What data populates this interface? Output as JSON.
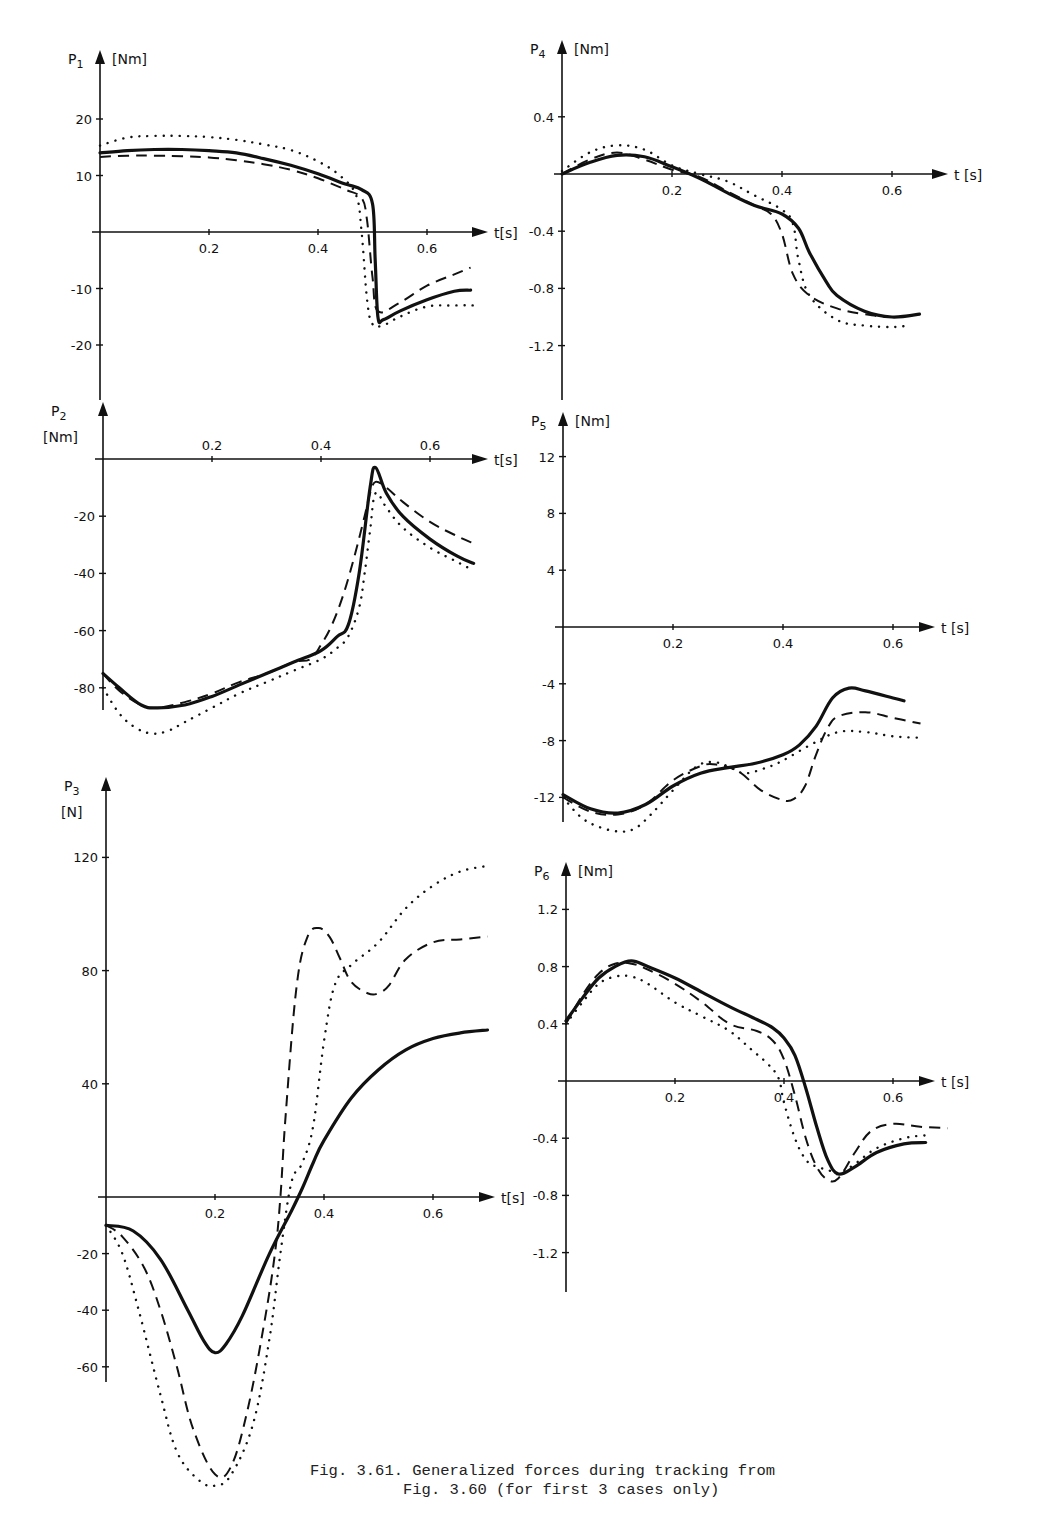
{
  "caption": {
    "line1": "Fig. 3.61. Generalized forces during tracking from",
    "line2": "          Fig. 3.60 (for first 3 cases only)"
  },
  "chart_data": [
    {
      "id": "P1",
      "type": "line",
      "title": "P1",
      "ylabel": "P1 [Nm]",
      "xlabel": "t[s]",
      "xticks": [
        0.2,
        0.4,
        0.6
      ],
      "yticks": [
        20,
        10,
        -10,
        -20
      ],
      "ylim": [
        -30,
        25
      ],
      "xlim": [
        0,
        0.7
      ],
      "frame": {
        "x0": 100,
        "y0": 232,
        "px_per_x": 545,
        "px_per_y": 5.65,
        "ytop": 50,
        "ybot": 400,
        "xend": 488
      },
      "series": [
        {
          "name": "case 1 (solid)",
          "style": "solid",
          "x": [
            0,
            0.05,
            0.1,
            0.15,
            0.2,
            0.25,
            0.3,
            0.35,
            0.4,
            0.45,
            0.48,
            0.5,
            0.505,
            0.51,
            0.52,
            0.55,
            0.6,
            0.65,
            0.68
          ],
          "y": [
            14,
            14.4,
            14.6,
            14.6,
            14.4,
            14,
            13,
            11.8,
            10.3,
            8.5,
            7.5,
            5,
            -5,
            -15,
            -15.5,
            -14,
            -12,
            -10.5,
            -10.3
          ]
        },
        {
          "name": "case 2 (dashed)",
          "style": "dashed",
          "x": [
            0,
            0.05,
            0.1,
            0.15,
            0.2,
            0.25,
            0.3,
            0.35,
            0.4,
            0.45,
            0.48,
            0.49,
            0.5,
            0.51,
            0.55,
            0.6,
            0.65,
            0.68
          ],
          "y": [
            13.3,
            13.5,
            13.5,
            13.4,
            13.2,
            12.7,
            12,
            11,
            9.5,
            7.5,
            6,
            2,
            -8,
            -14,
            -12.5,
            -9.5,
            -7.5,
            -6.3
          ]
        },
        {
          "name": "case 3 (dotted)",
          "style": "dotted",
          "x": [
            0,
            0.05,
            0.1,
            0.15,
            0.2,
            0.25,
            0.3,
            0.35,
            0.4,
            0.44,
            0.47,
            0.48,
            0.49,
            0.5,
            0.52,
            0.55,
            0.6,
            0.65,
            0.69
          ],
          "y": [
            15.3,
            16.7,
            17,
            17,
            16.8,
            16.3,
            15.5,
            14.5,
            12.5,
            10,
            6.5,
            0,
            -12,
            -16.3,
            -16.5,
            -15,
            -13.2,
            -13,
            -13
          ]
        }
      ]
    },
    {
      "id": "P2",
      "type": "line",
      "title": "P2",
      "ylabel": "P2 [Nm]",
      "xlabel": "t[s]",
      "xticks": [
        0.2,
        0.4,
        0.6
      ],
      "yticks": [
        -20,
        -40,
        -60,
        -80
      ],
      "ylim": [
        -100,
        10
      ],
      "xlim": [
        0,
        0.7
      ],
      "frame": {
        "x0": 103,
        "y0": 459,
        "px_per_x": 545,
        "px_per_y": 2.86,
        "ytop": 402,
        "ybot": 710,
        "xend": 488
      },
      "series": [
        {
          "name": "case 1 (solid)",
          "style": "solid",
          "x": [
            0,
            0.03,
            0.07,
            0.1,
            0.15,
            0.2,
            0.25,
            0.3,
            0.35,
            0.4,
            0.43,
            0.45,
            0.47,
            0.49,
            0.5,
            0.52,
            0.55,
            0.6,
            0.65,
            0.68
          ],
          "y": [
            -75,
            -80,
            -86,
            -87,
            -86,
            -83,
            -79,
            -75,
            -71,
            -67,
            -62,
            -58,
            -40,
            -10,
            -3,
            -12,
            -20,
            -28,
            -34,
            -36.5
          ]
        },
        {
          "name": "case 2 (dashed)",
          "style": "dashed",
          "x": [
            0,
            0.03,
            0.07,
            0.1,
            0.15,
            0.2,
            0.25,
            0.3,
            0.35,
            0.38,
            0.4,
            0.42,
            0.44,
            0.46,
            0.48,
            0.49,
            0.5,
            0.52,
            0.55,
            0.6,
            0.65,
            0.68
          ],
          "y": [
            -75,
            -81,
            -86,
            -87,
            -85,
            -82,
            -78,
            -75,
            -71,
            -70,
            -65,
            -58,
            -48,
            -35,
            -20,
            -12,
            -8,
            -10,
            -15,
            -22,
            -27,
            -29.5
          ]
        },
        {
          "name": "case 3 (dotted)",
          "style": "dotted",
          "x": [
            0,
            0.03,
            0.06,
            0.09,
            0.12,
            0.15,
            0.2,
            0.25,
            0.3,
            0.35,
            0.4,
            0.43,
            0.45,
            0.47,
            0.48,
            0.49,
            0.5,
            0.52,
            0.55,
            0.6,
            0.65,
            0.68
          ],
          "y": [
            -80,
            -89,
            -94,
            -96,
            -95,
            -92,
            -87,
            -82,
            -78,
            -74,
            -70,
            -66,
            -62,
            -52,
            -40,
            -25,
            -12,
            -17,
            -24,
            -31,
            -36,
            -39
          ]
        }
      ]
    },
    {
      "id": "P3",
      "type": "line",
      "title": "P3",
      "ylabel": "P3 [N]",
      "xlabel": "t[s]",
      "xticks": [
        0.2,
        0.4,
        0.6
      ],
      "yticks": [
        120,
        80,
        40,
        -20,
        -40,
        -60
      ],
      "ylim": [
        -90,
        140
      ],
      "xlim": [
        0,
        0.7
      ],
      "frame": {
        "x0": 106,
        "y0": 1197,
        "px_per_x": 545,
        "px_per_y": 2.83,
        "ytop": 777,
        "ybot": 1382,
        "xend": 495
      },
      "series": [
        {
          "name": "case 1 (solid)",
          "style": "solid",
          "x": [
            0,
            0.05,
            0.1,
            0.15,
            0.18,
            0.2,
            0.22,
            0.25,
            0.3,
            0.34,
            0.36,
            0.38,
            0.4,
            0.45,
            0.5,
            0.55,
            0.6,
            0.65,
            0.7
          ],
          "y": [
            -10,
            -12,
            -22,
            -40,
            -51,
            -55,
            -52,
            -42,
            -20,
            -5,
            3,
            12,
            20,
            35,
            45,
            52,
            56,
            58,
            59
          ]
        },
        {
          "name": "case 2 (dashed)",
          "style": "dashed",
          "x": [
            0,
            0.03,
            0.07,
            0.1,
            0.13,
            0.16,
            0.2,
            0.23,
            0.26,
            0.29,
            0.31,
            0.32,
            0.33,
            0.35,
            0.37,
            0.39,
            0.41,
            0.43,
            0.45,
            0.48,
            0.5,
            0.52,
            0.55,
            0.6,
            0.65,
            0.7
          ],
          "y": [
            -10,
            -14,
            -25,
            -40,
            -60,
            -82,
            -98,
            -95,
            -75,
            -45,
            -20,
            0,
            30,
            75,
            92,
            95,
            92,
            84,
            76,
            72,
            72,
            75,
            84,
            90,
            91,
            92
          ]
        },
        {
          "name": "case 3 (dotted)",
          "style": "dotted",
          "x": [
            0,
            0.03,
            0.06,
            0.1,
            0.13,
            0.17,
            0.2,
            0.23,
            0.27,
            0.3,
            0.32,
            0.34,
            0.36,
            0.38,
            0.4,
            0.42,
            0.45,
            0.5,
            0.55,
            0.6,
            0.65,
            0.7
          ],
          "y": [
            -10,
            -20,
            -40,
            -70,
            -90,
            -100,
            -102,
            -98,
            -80,
            -50,
            -20,
            5,
            12,
            25,
            55,
            75,
            82,
            90,
            102,
            110,
            115,
            117
          ]
        }
      ]
    },
    {
      "id": "P4",
      "type": "line",
      "title": "P4",
      "ylabel": "P4 [Nm]",
      "xlabel": "t [s]",
      "xticks": [
        0.2,
        0.4,
        0.6
      ],
      "yticks": [
        0.4,
        -0.4,
        -0.8,
        -1.2
      ],
      "ylim": [
        -1.6,
        0.6
      ],
      "xlim": [
        0,
        0.7
      ],
      "frame": {
        "x0": 562,
        "y0": 174,
        "px_per_x": 550,
        "px_per_y": 143,
        "ytop": 40,
        "ybot": 400,
        "xend": 948
      },
      "series": [
        {
          "name": "case 1 (solid)",
          "style": "solid",
          "x": [
            0,
            0.05,
            0.1,
            0.15,
            0.2,
            0.25,
            0.3,
            0.35,
            0.4,
            0.43,
            0.45,
            0.48,
            0.5,
            0.55,
            0.6,
            0.65
          ],
          "y": [
            0,
            0.08,
            0.13,
            0.12,
            0.05,
            -0.03,
            -0.13,
            -0.22,
            -0.28,
            -0.38,
            -0.55,
            -0.75,
            -0.85,
            -0.96,
            -1.0,
            -0.98
          ]
        },
        {
          "name": "case 2 (dashed)",
          "style": "dashed",
          "x": [
            0,
            0.05,
            0.1,
            0.15,
            0.2,
            0.25,
            0.3,
            0.35,
            0.38,
            0.4,
            0.42,
            0.45,
            0.5,
            0.55,
            0.6,
            0.65
          ],
          "y": [
            0,
            0.1,
            0.15,
            0.1,
            0.03,
            -0.02,
            -0.12,
            -0.22,
            -0.28,
            -0.42,
            -0.7,
            -0.85,
            -0.94,
            -0.98,
            -1.0,
            -0.98
          ]
        },
        {
          "name": "case 3 (dotted)",
          "style": "dotted",
          "x": [
            0,
            0.05,
            0.1,
            0.15,
            0.2,
            0.25,
            0.3,
            0.35,
            0.4,
            0.42,
            0.43,
            0.45,
            0.5,
            0.55,
            0.6,
            0.63
          ],
          "y": [
            0.02,
            0.15,
            0.2,
            0.17,
            0.06,
            0.0,
            -0.05,
            -0.15,
            -0.25,
            -0.35,
            -0.6,
            -0.85,
            -1.02,
            -1.06,
            -1.07,
            -1.06
          ]
        }
      ]
    },
    {
      "id": "P5",
      "type": "line",
      "title": "P5",
      "ylabel": "P5 [Nm]",
      "xlabel": "t [s]",
      "xticks": [
        0.2,
        0.4,
        0.6
      ],
      "yticks": [
        12,
        8,
        4,
        -4,
        -8,
        -12
      ],
      "ylim": [
        -14,
        14
      ],
      "xlim": [
        0,
        0.7
      ],
      "frame": {
        "x0": 563,
        "y0": 627,
        "px_per_x": 550,
        "px_per_y": 14.2,
        "ytop": 412,
        "ybot": 822,
        "xend": 935
      },
      "series": [
        {
          "name": "case 1 (solid)",
          "style": "solid",
          "x": [
            0,
            0.05,
            0.1,
            0.15,
            0.2,
            0.25,
            0.3,
            0.35,
            0.4,
            0.43,
            0.46,
            0.49,
            0.52,
            0.55,
            0.6,
            0.62
          ],
          "y": [
            -11.8,
            -12.8,
            -13.1,
            -12.5,
            -11.2,
            -10.3,
            -9.9,
            -9.6,
            -9.0,
            -8.3,
            -7.0,
            -5.0,
            -4.3,
            -4.5,
            -5.0,
            -5.2
          ]
        },
        {
          "name": "case 2 (dashed)",
          "style": "dashed",
          "x": [
            0,
            0.05,
            0.1,
            0.15,
            0.2,
            0.25,
            0.28,
            0.32,
            0.36,
            0.4,
            0.42,
            0.44,
            0.46,
            0.48,
            0.5,
            0.55,
            0.6,
            0.65
          ],
          "y": [
            -12,
            -13,
            -13.2,
            -12.5,
            -10.8,
            -9.8,
            -9.7,
            -10.2,
            -11.5,
            -12.2,
            -12.1,
            -11.2,
            -9.0,
            -7.2,
            -6.3,
            -6.0,
            -6.4,
            -6.8
          ]
        },
        {
          "name": "case 3 (dotted)",
          "style": "dotted",
          "x": [
            0,
            0.03,
            0.06,
            0.1,
            0.13,
            0.16,
            0.2,
            0.24,
            0.27,
            0.3,
            0.33,
            0.37,
            0.4,
            0.45,
            0.5,
            0.55,
            0.6,
            0.65
          ],
          "y": [
            -12,
            -13.3,
            -14.0,
            -14.4,
            -14.2,
            -13.2,
            -11.5,
            -9.9,
            -9.5,
            -9.8,
            -10.3,
            -9.9,
            -9.4,
            -8.3,
            -7.4,
            -7.4,
            -7.7,
            -7.8
          ]
        }
      ]
    },
    {
      "id": "P6",
      "type": "line",
      "title": "P6",
      "ylabel": "P6 [Nm]",
      "xlabel": "t[s]",
      "xticks": [
        0.2,
        0.4,
        0.6
      ],
      "yticks": [
        1.2,
        0.8,
        0.4,
        -0.4,
        -0.8,
        -1.2
      ],
      "ylim": [
        -1.5,
        1.4
      ],
      "xlim": [
        0,
        0.7
      ],
      "frame": {
        "x0": 566,
        "y0": 1081,
        "px_per_x": 545,
        "px_per_y": 143,
        "ytop": 862,
        "ybot": 1292,
        "xend": 935
      },
      "series": [
        {
          "name": "case 1 (solid)",
          "style": "solid",
          "x": [
            0,
            0.03,
            0.06,
            0.09,
            0.12,
            0.15,
            0.2,
            0.25,
            0.3,
            0.35,
            0.38,
            0.4,
            0.42,
            0.44,
            0.46,
            0.48,
            0.5,
            0.53,
            0.57,
            0.62,
            0.66
          ],
          "y": [
            0.42,
            0.58,
            0.72,
            0.8,
            0.84,
            0.8,
            0.72,
            0.62,
            0.52,
            0.43,
            0.37,
            0.3,
            0.18,
            -0.05,
            -0.32,
            -0.55,
            -0.65,
            -0.6,
            -0.5,
            -0.44,
            -0.43
          ]
        },
        {
          "name": "case 2 (dashed)",
          "style": "dashed",
          "x": [
            0,
            0.03,
            0.06,
            0.09,
            0.12,
            0.15,
            0.2,
            0.25,
            0.3,
            0.35,
            0.38,
            0.4,
            0.42,
            0.44,
            0.46,
            0.48,
            0.5,
            0.53,
            0.56,
            0.6,
            0.65,
            0.7
          ],
          "y": [
            0.4,
            0.6,
            0.75,
            0.82,
            0.82,
            0.78,
            0.68,
            0.55,
            0.4,
            0.35,
            0.28,
            0.15,
            -0.1,
            -0.4,
            -0.6,
            -0.69,
            -0.68,
            -0.5,
            -0.35,
            -0.3,
            -0.32,
            -0.33
          ]
        },
        {
          "name": "case 3 (dotted)",
          "style": "dotted",
          "x": [
            0,
            0.03,
            0.06,
            0.09,
            0.12,
            0.15,
            0.2,
            0.25,
            0.3,
            0.34,
            0.37,
            0.39,
            0.4,
            0.42,
            0.44,
            0.46,
            0.48,
            0.5,
            0.53,
            0.57,
            0.62,
            0.66
          ],
          "y": [
            0.4,
            0.55,
            0.68,
            0.73,
            0.73,
            0.68,
            0.55,
            0.45,
            0.35,
            0.22,
            0.12,
            0.02,
            -0.15,
            -0.4,
            -0.55,
            -0.6,
            -0.62,
            -0.65,
            -0.58,
            -0.47,
            -0.4,
            -0.38
          ]
        }
      ]
    }
  ],
  "labels": {
    "P1": {
      "sym": "P",
      "sub": "1",
      "unit": "[Nm]",
      "t": "t[s]"
    },
    "P2": {
      "sym": "P",
      "sub": "2",
      "unit": "[Nm]",
      "t": "t[s]"
    },
    "P3": {
      "sym": "P",
      "sub": "3",
      "unit": "[N]",
      "t": "t[s]"
    },
    "P4": {
      "sym": "P",
      "sub": "4",
      "unit": "[Nm]",
      "t": "t [s]"
    },
    "P5": {
      "sym": "P",
      "sub": "5",
      "unit": "[Nm]",
      "t": "t [s]"
    },
    "P6": {
      "sym": "P",
      "sub": "6",
      "unit": "[Nm]",
      "t": "t [s]"
    }
  }
}
